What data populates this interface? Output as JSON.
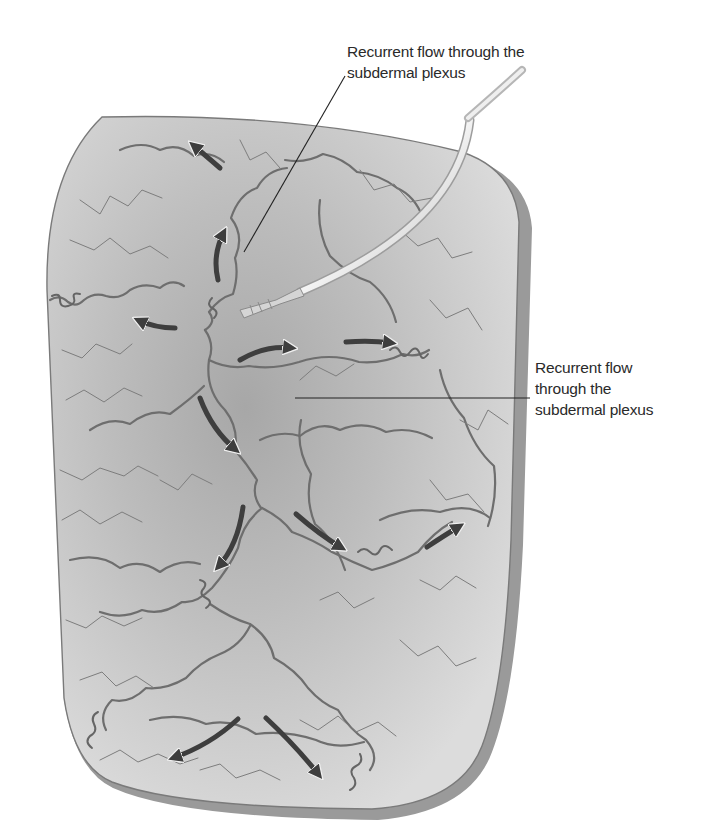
{
  "figure": {
    "colors": {
      "background": "#ffffff",
      "flap_fill": "#d6d6d6",
      "flap_center": "#a9a9a9",
      "flap_edge": "#7a7a7a",
      "vessels": "#6b6b6b",
      "arrows": "#3e3e3e",
      "cannula": "#e4e4e4",
      "leader_line": "#222222",
      "text": "#2a2a2a"
    }
  },
  "labels": {
    "top": {
      "lines": [
        "Recurrent flow through the",
        "subdermal plexus"
      ]
    },
    "right": {
      "lines": [
        "Recurrent flow",
        "through the",
        "subdermal plexus"
      ]
    }
  },
  "arrows": [
    {
      "name": "arrow-up-left-top",
      "direction": "up-left"
    },
    {
      "name": "arrow-up-center",
      "direction": "up"
    },
    {
      "name": "arrow-left-middle",
      "direction": "left"
    },
    {
      "name": "arrow-right-1",
      "direction": "right"
    },
    {
      "name": "arrow-right-2",
      "direction": "right"
    },
    {
      "name": "arrow-down-right-1",
      "direction": "down-right"
    },
    {
      "name": "arrow-down-left-1",
      "direction": "down-left"
    },
    {
      "name": "arrow-down-right-2",
      "direction": "down-right"
    },
    {
      "name": "arrow-up-right",
      "direction": "up-right"
    },
    {
      "name": "arrow-down-left-2",
      "direction": "down-left"
    },
    {
      "name": "arrow-down-right-3",
      "direction": "down-right"
    }
  ]
}
